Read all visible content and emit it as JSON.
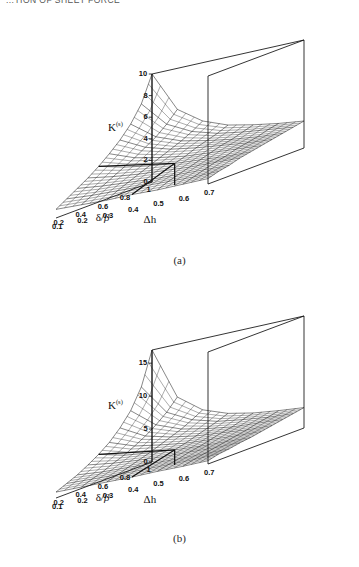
{
  "page": {
    "running_head": "...TION OF SHEET FORCE"
  },
  "figures": [
    {
      "caption": "(a)",
      "name": "figure-a"
    },
    {
      "caption": "(b)",
      "name": "figure-b"
    }
  ],
  "chart_data": [
    {
      "type": "surface",
      "panel": "(a)",
      "title": "",
      "zlabel": "K(s)",
      "zlabel_base": "K",
      "zlabel_sup": "(s)",
      "xlabel": "δ/β",
      "ylabel": "Δh",
      "grid": true,
      "legend": "none",
      "mesh_style": "wireframe",
      "zlim": [
        0,
        10
      ],
      "zticks": [
        0,
        2,
        4,
        6,
        8,
        10
      ],
      "ztick_labels": [
        "0",
        "2",
        "4",
        "6",
        "8",
        "10"
      ],
      "xlim": [
        0.1,
        1.0
      ],
      "xticks": [
        1,
        0.8,
        0.6,
        0.4,
        0.2
      ],
      "xtick_labels": [
        "1",
        "0.8",
        "0.6",
        "0.4",
        "0.2"
      ],
      "ylim": [
        0.1,
        0.7
      ],
      "yticks": [
        0.1,
        0.2,
        0.3,
        0.4,
        0.5,
        0.6,
        0.7
      ],
      "ytick_labels": [
        "0.1",
        "0.2",
        "0.3",
        "0.4",
        "0.5",
        "0.6",
        "0.7"
      ],
      "x": [
        1.0,
        0.9,
        0.8,
        0.7,
        0.6,
        0.5,
        0.4,
        0.3,
        0.2,
        0.1
      ],
      "y": [
        0.1,
        0.2,
        0.3,
        0.4,
        0.5,
        0.6,
        0.7
      ],
      "z": [
        [
          10.0,
          6.2,
          4.6,
          3.7,
          3.2,
          2.8,
          2.5
        ],
        [
          7.6,
          5.2,
          4.0,
          3.3,
          2.9,
          2.6,
          2.3
        ],
        [
          6.1,
          4.4,
          3.5,
          3.0,
          2.6,
          2.3,
          2.1
        ],
        [
          5.0,
          3.8,
          3.1,
          2.7,
          2.4,
          2.1,
          1.9
        ],
        [
          4.1,
          3.2,
          2.7,
          2.3,
          2.1,
          1.9,
          1.7
        ],
        [
          3.3,
          2.7,
          2.3,
          2.0,
          1.8,
          1.6,
          1.5
        ],
        [
          2.6,
          2.2,
          1.9,
          1.7,
          1.5,
          1.4,
          1.3
        ],
        [
          2.0,
          1.7,
          1.5,
          1.3,
          1.2,
          1.1,
          1.0
        ],
        [
          1.4,
          1.2,
          1.1,
          1.0,
          0.9,
          0.8,
          0.8
        ],
        [
          0.8,
          0.7,
          0.6,
          0.6,
          0.5,
          0.5,
          0.5
        ]
      ],
      "notes": "Monotonically decreasing surface; peak at delta/beta = 1, Delta h = 0.1"
    },
    {
      "type": "surface",
      "panel": "(b)",
      "title": "",
      "zlabel": "K(s)",
      "zlabel_base": "K",
      "zlabel_sup": "(s)",
      "xlabel": "δ/β",
      "ylabel": "Δh",
      "grid": true,
      "legend": "none",
      "mesh_style": "wireframe",
      "zlim": [
        0,
        17
      ],
      "zticks": [
        0,
        5,
        10,
        15
      ],
      "ztick_labels": [
        "0",
        "5",
        "10",
        "15"
      ],
      "xlim": [
        0.1,
        1.0
      ],
      "xticks": [
        1,
        0.8,
        0.6,
        0.4,
        0.2
      ],
      "xtick_labels": [
        "1",
        "0.8",
        "0.6",
        "0.4",
        "0.2"
      ],
      "ylim": [
        0.1,
        0.7
      ],
      "yticks": [
        0.1,
        0.2,
        0.3,
        0.4,
        0.5,
        0.6,
        0.7
      ],
      "ytick_labels": [
        "0.1",
        "0.2",
        "0.3",
        "0.4",
        "0.5",
        "0.6",
        "0.7"
      ],
      "x": [
        1.0,
        0.9,
        0.8,
        0.7,
        0.6,
        0.5,
        0.4,
        0.3,
        0.2,
        0.1
      ],
      "y": [
        0.1,
        0.2,
        0.3,
        0.4,
        0.5,
        0.6,
        0.7
      ],
      "z": [
        [
          17.0,
          9.0,
          6.2,
          4.8,
          4.0,
          3.5,
          3.1
        ],
        [
          12.0,
          7.3,
          5.3,
          4.2,
          3.6,
          3.1,
          2.8
        ],
        [
          9.0,
          6.0,
          4.5,
          3.7,
          3.1,
          2.8,
          2.5
        ],
        [
          7.0,
          4.9,
          3.9,
          3.2,
          2.8,
          2.4,
          2.2
        ],
        [
          5.4,
          4.0,
          3.3,
          2.7,
          2.4,
          2.1,
          1.9
        ],
        [
          4.2,
          3.2,
          2.7,
          2.3,
          2.0,
          1.8,
          1.6
        ],
        [
          3.2,
          2.6,
          2.2,
          1.9,
          1.7,
          1.5,
          1.4
        ],
        [
          2.3,
          1.9,
          1.7,
          1.5,
          1.3,
          1.2,
          1.1
        ],
        [
          1.6,
          1.4,
          1.2,
          1.1,
          1.0,
          0.9,
          0.9
        ],
        [
          0.9,
          0.8,
          0.7,
          0.6,
          0.6,
          0.5,
          0.5
        ]
      ],
      "notes": "Same form as (a) but larger peak value near 17 at delta/beta = 1, Delta h = 0.1"
    }
  ]
}
